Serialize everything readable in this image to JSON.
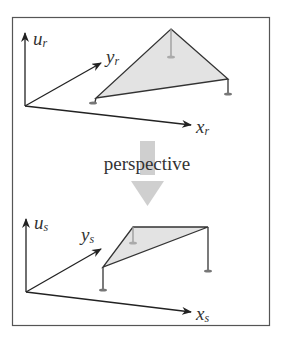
{
  "diagram": {
    "caption": "perspective",
    "top": {
      "axes": {
        "u": {
          "base": "u",
          "sub": "r"
        },
        "y": {
          "base": "y",
          "sub": "r"
        },
        "x": {
          "base": "x",
          "sub": "r"
        }
      }
    },
    "bottom": {
      "axes": {
        "u": {
          "base": "u",
          "sub": "s"
        },
        "y": {
          "base": "y",
          "sub": "s"
        },
        "x": {
          "base": "x",
          "sub": "s"
        }
      }
    },
    "colors": {
      "line": "#333333",
      "fill": "#e3e3e3",
      "arrow": "#cfcfcf",
      "frame": "#555555"
    }
  }
}
